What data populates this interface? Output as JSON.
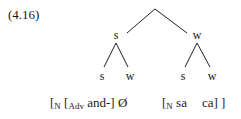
{
  "example_number": "(4.16)",
  "tree": {
    "root": {
      "x": 155,
      "y": 9
    },
    "nodes": [
      {
        "id": "L",
        "label": "s",
        "x": 116,
        "y": 29
      },
      {
        "id": "R",
        "label": "w",
        "x": 197,
        "y": 29
      },
      {
        "id": "LL",
        "label": "s",
        "x": 102,
        "y": 70
      },
      {
        "id": "LR",
        "label": "w",
        "x": 130,
        "y": 70
      },
      {
        "id": "RL",
        "label": "s",
        "x": 183,
        "y": 70
      },
      {
        "id": "RR",
        "label": "w",
        "x": 212,
        "y": 70
      }
    ]
  },
  "bracketing": {
    "left": {
      "open1": "[",
      "sub1": "N",
      "open2": " [",
      "sub2": "Adv",
      "word": " and-]",
      "null": " Ø"
    },
    "right": {
      "open1": "[",
      "sub1": "N",
      "word1": " sa",
      "word2": "ca]",
      "close": " ]"
    }
  }
}
